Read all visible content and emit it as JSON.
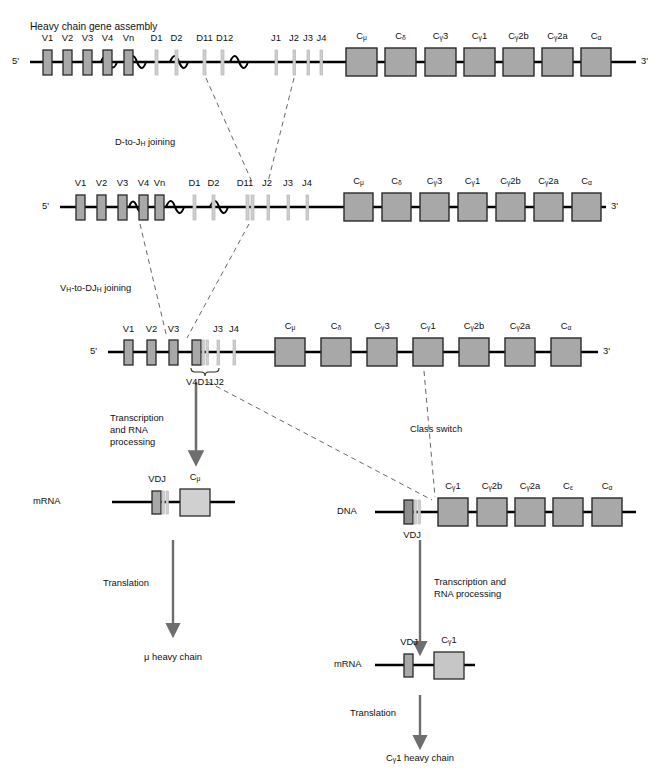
{
  "figure": {
    "title": "Heavy chain gene assembly",
    "colors": {
      "box_fill": "#a8a8a8",
      "box_stroke": "#2a2a2a",
      "line": "#000000",
      "arrow": "#6e6e6e",
      "dashed": "#555555",
      "segment_light": "#cfcfcf"
    }
  },
  "row1": {
    "name": "germline-dna",
    "five_prime": "5'",
    "three_prime": "3'",
    "v_genes": [
      "V1",
      "V2",
      "V3",
      "V4",
      "Vn"
    ],
    "d_genes": [
      "D1",
      "D2",
      "D11",
      "D12"
    ],
    "j_genes": [
      "J1",
      "J2",
      "J3",
      "J4"
    ],
    "c_genes": [
      "Cμ",
      "Cδ3",
      "Cγ3",
      "Cγ1",
      "Cγ2b",
      "Cγ2a",
      "Cε",
      "Cα"
    ],
    "c_genes_display": [
      {
        "base": "C",
        "sub": "μ",
        "post": ""
      },
      {
        "base": "C",
        "sub": "δ",
        "post": ""
      },
      {
        "base": "C",
        "sub": "γ",
        "post": "3"
      },
      {
        "base": "C",
        "sub": "γ",
        "post": "1"
      },
      {
        "base": "C",
        "sub": "γ",
        "post": "2b"
      },
      {
        "base": "C",
        "sub": "γ",
        "post": "2a"
      },
      {
        "base": "C",
        "sub": "ε",
        "post": ""
      },
      {
        "base": "C",
        "sub": "α",
        "post": ""
      }
    ]
  },
  "step1": {
    "label_pre": "D-to-J",
    "label_sub": "H",
    "label_post": " joining"
  },
  "row2": {
    "name": "d-to-j-joined-dna",
    "five_prime": "5'",
    "three_prime": "3'",
    "v_genes": [
      "V1",
      "V2",
      "V3",
      "V4",
      "Vn"
    ],
    "d_genes": [
      "D1",
      "D2",
      "D11"
    ],
    "j_genes": [
      "J2",
      "J3",
      "J4"
    ]
  },
  "step2": {
    "label_pre": "V",
    "label_sub1": "H",
    "label_mid": "-to-DJ",
    "label_sub2": "H",
    "label_post": " joining"
  },
  "row3": {
    "name": "vdj-joined-dna",
    "five_prime": "5'",
    "three_prime": "3'",
    "v_genes": [
      "V1",
      "V2",
      "V3"
    ],
    "rearranged_label": "V4D11J2",
    "j_genes": [
      "J3",
      "J4"
    ]
  },
  "left_branch": {
    "arrow_label": "Transcription\nand RNA\nprocessing",
    "mrna_label": "mRNA",
    "vdj_label": "VDJ",
    "c_label": {
      "base": "C",
      "sub": "μ",
      "post": ""
    },
    "translation_label": "Translation",
    "product_label": "μ heavy chain"
  },
  "class_switch": {
    "label": "Class switch"
  },
  "right_branch": {
    "dna_label": "DNA",
    "vdj_label": "VDJ",
    "c_genes_display": [
      {
        "base": "C",
        "sub": "γ",
        "post": "1"
      },
      {
        "base": "C",
        "sub": "γ",
        "post": "2b"
      },
      {
        "base": "C",
        "sub": "γ",
        "post": "2a"
      },
      {
        "base": "C",
        "sub": "ε",
        "post": ""
      },
      {
        "base": "C",
        "sub": "α",
        "post": ""
      }
    ],
    "arrow_label": "Transcription and\nRNA processing",
    "mrna_label": "mRNA",
    "mrna_vdj_label": "VDJ",
    "mrna_c_label": {
      "base": "C",
      "sub": "γ",
      "post": "1"
    },
    "translation_label": "Translation",
    "product_label": {
      "base": "C",
      "sub": "γ",
      "post": "1 heavy chain"
    }
  }
}
